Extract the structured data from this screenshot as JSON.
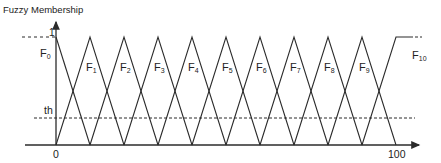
{
  "diagram": {
    "title": "Fuzzy Membership",
    "y_axis": {
      "label": "Fuzzy Membership",
      "top_value_label": "1",
      "threshold_label": "th"
    },
    "x_axis": {
      "min_label": "0",
      "max_label": "100"
    },
    "colors": {
      "line": "#2b2b2b",
      "background": "#ffffff"
    },
    "sets": [
      {
        "name": "F",
        "sub": "0",
        "shape": "left-shoulder"
      },
      {
        "name": "F",
        "sub": "1",
        "shape": "triangle"
      },
      {
        "name": "F",
        "sub": "2",
        "shape": "triangle"
      },
      {
        "name": "F",
        "sub": "3",
        "shape": "triangle"
      },
      {
        "name": "F",
        "sub": "4",
        "shape": "triangle"
      },
      {
        "name": "F",
        "sub": "5",
        "shape": "triangle"
      },
      {
        "name": "F",
        "sub": "6",
        "shape": "triangle"
      },
      {
        "name": "F",
        "sub": "7",
        "shape": "triangle"
      },
      {
        "name": "F",
        "sub": "8",
        "shape": "triangle"
      },
      {
        "name": "F",
        "sub": "9",
        "shape": "triangle"
      },
      {
        "name": "F",
        "sub": "10",
        "shape": "right-shoulder"
      }
    ],
    "threshold": {
      "style": "dashed",
      "approx_value": 0.25
    }
  }
}
